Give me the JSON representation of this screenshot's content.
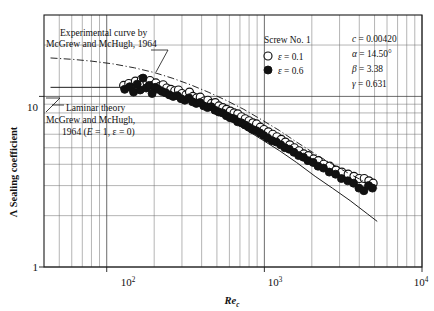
{
  "figure": {
    "name": "sealing-coefficient-vs-reynolds-number",
    "background": "#ffffff",
    "ink_color": "#111111"
  },
  "axes": {
    "x": {
      "label": "Re",
      "label_sub": "c",
      "scale": "log",
      "min": 40,
      "max": 10000,
      "tick_labels": [
        "10",
        "10",
        "10"
      ],
      "tick_exponents": [
        "2",
        "3",
        "4"
      ],
      "tick_values": [
        100,
        1000,
        10000
      ]
    },
    "y": {
      "label_symbol": "Λ",
      "label_text": "Sealing coefficient",
      "scale": "log",
      "min": 1,
      "max": 30,
      "tick_labels": [
        "10",
        "1"
      ],
      "tick_values": [
        10,
        1
      ]
    }
  },
  "annotations": {
    "experimental": {
      "line1": "Experimental curve by",
      "line2": "McGrew and McHugh, 1964"
    },
    "laminar": {
      "line1": "Laminar theory",
      "line2": "McGrew and McHugh,",
      "line3_prefix": "1964 (",
      "line3_E": "E",
      "line3_mid": " = 1, ε = 0)"
    }
  },
  "legend": {
    "title": "Screw No. 1",
    "entries": [
      {
        "marker": "open-circle",
        "symbol": "ε",
        "value": " = 0.1"
      },
      {
        "marker": "filled-circle",
        "symbol": "ε",
        "value": " = 0.6"
      }
    ]
  },
  "parameters": [
    {
      "symbol": "c",
      "value": " = 0.00420"
    },
    {
      "symbol": "α",
      "value": " = 14.50°"
    },
    {
      "symbol": "β",
      "value": " = 3.38"
    },
    {
      "symbol": "γ",
      "value": " = 0.631"
    }
  ],
  "chart_data": {
    "type": "scatter",
    "title": "",
    "xlabel": "Re_c",
    "ylabel": "Λ Sealing coefficient",
    "xscale": "log",
    "yscale": "log",
    "xlim": [
      40,
      10000
    ],
    "ylim": [
      1,
      30
    ],
    "grid": true,
    "legend_position": "top-right",
    "series": [
      {
        "name": "ε = 0.1",
        "marker": "open-circle",
        "points": [
          [
            128,
            11.6
          ],
          [
            138,
            11.9
          ],
          [
            145,
            11.2
          ],
          [
            152,
            12.3
          ],
          [
            158,
            11.5
          ],
          [
            166,
            12.6
          ],
          [
            172,
            11.8
          ],
          [
            180,
            12.1
          ],
          [
            188,
            12.4
          ],
          [
            196,
            11.6
          ],
          [
            205,
            12.0
          ],
          [
            215,
            11.4
          ],
          [
            228,
            11.7
          ],
          [
            240,
            11.2
          ],
          [
            255,
            11.0
          ],
          [
            270,
            10.8
          ],
          [
            285,
            10.9
          ],
          [
            300,
            10.4
          ],
          [
            318,
            10.2
          ],
          [
            335,
            10.6
          ],
          [
            352,
            10.0
          ],
          [
            372,
            9.8
          ],
          [
            392,
            9.9
          ],
          [
            415,
            9.4
          ],
          [
            438,
            9.5
          ],
          [
            462,
            9.1
          ],
          [
            488,
            9.2
          ],
          [
            515,
            8.8
          ],
          [
            545,
            8.6
          ],
          [
            575,
            8.4
          ],
          [
            608,
            8.2
          ],
          [
            642,
            8.0
          ],
          [
            678,
            7.9
          ],
          [
            716,
            7.6
          ],
          [
            756,
            7.4
          ],
          [
            800,
            7.2
          ],
          [
            845,
            7.0
          ],
          [
            892,
            6.9
          ],
          [
            942,
            6.6
          ],
          [
            995,
            6.4
          ],
          [
            1060,
            6.2
          ],
          [
            1130,
            6.0
          ],
          [
            1200,
            5.8
          ],
          [
            1280,
            5.6
          ],
          [
            1360,
            5.4
          ],
          [
            1450,
            5.2
          ],
          [
            1550,
            5.0
          ],
          [
            1660,
            4.8
          ],
          [
            1780,
            4.6
          ],
          [
            1900,
            4.5
          ],
          [
            2050,
            4.3
          ],
          [
            2200,
            4.2
          ],
          [
            2380,
            4.0
          ],
          [
            2600,
            3.9
          ],
          [
            2850,
            3.7
          ],
          [
            3100,
            3.6
          ],
          [
            3400,
            3.5
          ],
          [
            3700,
            3.4
          ],
          [
            4000,
            3.3
          ],
          [
            4300,
            3.3
          ],
          [
            4600,
            3.2
          ],
          [
            4900,
            3.1
          ]
        ]
      },
      {
        "name": "ε = 0.6",
        "marker": "filled-circle",
        "points": [
          [
            130,
            11.0
          ],
          [
            140,
            11.4
          ],
          [
            148,
            10.6
          ],
          [
            156,
            11.8
          ],
          [
            163,
            10.9
          ],
          [
            170,
            12.8
          ],
          [
            178,
            11.2
          ],
          [
            186,
            11.6
          ],
          [
            194,
            10.4
          ],
          [
            203,
            11.3
          ],
          [
            212,
            11.0
          ],
          [
            224,
            10.7
          ],
          [
            236,
            10.5
          ],
          [
            250,
            10.2
          ],
          [
            264,
            10.0
          ],
          [
            280,
            10.1
          ],
          [
            296,
            9.7
          ],
          [
            313,
            9.5
          ],
          [
            332,
            9.8
          ],
          [
            350,
            9.3
          ],
          [
            370,
            9.1
          ],
          [
            390,
            9.2
          ],
          [
            412,
            8.8
          ],
          [
            436,
            8.6
          ],
          [
            460,
            8.7
          ],
          [
            486,
            8.3
          ],
          [
            514,
            8.1
          ],
          [
            543,
            8.0
          ],
          [
            574,
            7.7
          ],
          [
            606,
            7.5
          ],
          [
            640,
            7.4
          ],
          [
            676,
            7.1
          ],
          [
            714,
            7.0
          ],
          [
            754,
            6.8
          ],
          [
            796,
            6.6
          ],
          [
            840,
            6.4
          ],
          [
            888,
            6.3
          ],
          [
            938,
            6.1
          ],
          [
            990,
            5.9
          ],
          [
            1050,
            5.7
          ],
          [
            1120,
            5.5
          ],
          [
            1190,
            5.4
          ],
          [
            1270,
            5.2
          ],
          [
            1350,
            5.0
          ],
          [
            1440,
            4.9
          ],
          [
            1540,
            4.7
          ],
          [
            1650,
            4.5
          ],
          [
            1770,
            4.4
          ],
          [
            1890,
            4.2
          ],
          [
            2040,
            4.1
          ],
          [
            2190,
            3.9
          ],
          [
            2370,
            3.8
          ],
          [
            2580,
            3.6
          ],
          [
            2830,
            3.5
          ],
          [
            3080,
            3.3
          ],
          [
            3380,
            3.2
          ],
          [
            3680,
            3.1
          ],
          [
            3980,
            2.9
          ],
          [
            4280,
            2.8
          ],
          [
            4580,
            3.0
          ],
          [
            4850,
            2.9
          ]
        ]
      }
    ],
    "curves": [
      {
        "name": "Experimental curve by McGrew and McHugh, 1964",
        "style": "dash-dot",
        "points": [
          [
            44,
            16.8
          ],
          [
            60,
            16.5
          ],
          [
            80,
            16.1
          ],
          [
            110,
            15.5
          ],
          [
            150,
            14.7
          ],
          [
            200,
            13.8
          ],
          [
            260,
            12.8
          ],
          [
            340,
            11.7
          ],
          [
            440,
            10.6
          ],
          [
            570,
            9.5
          ],
          [
            740,
            8.4
          ],
          [
            960,
            7.3
          ],
          [
            1250,
            6.3
          ],
          [
            1600,
            5.4
          ],
          [
            2100,
            4.6
          ],
          [
            2700,
            4.0
          ],
          [
            3500,
            3.5
          ],
          [
            4500,
            3.1
          ],
          [
            5200,
            2.9
          ]
        ]
      },
      {
        "name": "Laminar theory McGrew and McHugh, 1964 (E = 1, ε = 0)",
        "style": "solid",
        "points": [
          [
            44,
            11.3
          ],
          [
            80,
            11.3
          ],
          [
            120,
            11.3
          ],
          [
            160,
            11.25
          ],
          [
            200,
            11.0
          ],
          [
            260,
            10.4
          ],
          [
            340,
            9.5
          ],
          [
            440,
            8.5
          ],
          [
            570,
            7.5
          ],
          [
            740,
            6.5
          ],
          [
            960,
            5.6
          ],
          [
            1250,
            4.8
          ],
          [
            1600,
            4.1
          ],
          [
            2100,
            3.4
          ],
          [
            2700,
            2.9
          ],
          [
            3500,
            2.45
          ],
          [
            4500,
            2.05
          ],
          [
            5200,
            1.85
          ]
        ]
      }
    ]
  }
}
